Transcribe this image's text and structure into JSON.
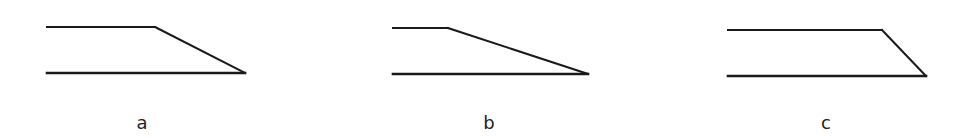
{
  "figure": {
    "stroke_color": "#1a1a1a",
    "panels": [
      {
        "label": "a",
        "label_pos": [
          142,
          114
        ],
        "top_line": [
          [
            47,
            27
          ],
          [
            155,
            27
          ]
        ],
        "slant_line": [
          [
            155,
            27
          ],
          [
            245,
            73
          ]
        ],
        "bottom_line": [
          [
            47,
            73
          ],
          [
            245,
            73
          ]
        ]
      },
      {
        "label": "b",
        "label_pos": [
          489,
          114
        ],
        "top_line": [
          [
            393,
            28
          ],
          [
            448,
            28
          ]
        ],
        "slant_line": [
          [
            448,
            28
          ],
          [
            588,
            74
          ]
        ],
        "bottom_line": [
          [
            393,
            74
          ],
          [
            588,
            74
          ]
        ]
      },
      {
        "label": "c",
        "label_pos": [
          826,
          114
        ],
        "top_line": [
          [
            728,
            30
          ],
          [
            882,
            30
          ]
        ],
        "slant_line": [
          [
            882,
            30
          ],
          [
            926,
            76
          ]
        ],
        "bottom_line": [
          [
            728,
            76
          ],
          [
            926,
            76
          ]
        ]
      }
    ]
  }
}
